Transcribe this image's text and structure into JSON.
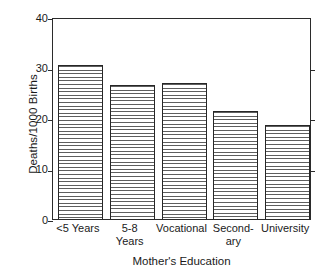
{
  "chart_data": {
    "type": "bar",
    "title": "",
    "xlabel": "Mother's Education",
    "ylabel": "Deaths/1000 Births",
    "categories": [
      "<5 Years",
      "5-8 Years",
      "Vocational",
      "Secondary",
      "University"
    ],
    "category_lines": [
      [
        "<5 Years"
      ],
      [
        "5-8",
        "Years"
      ],
      [
        "Vocational"
      ],
      [
        "Second-",
        "ary"
      ],
      [
        "University"
      ]
    ],
    "values": [
      30.5,
      26.6,
      27.0,
      21.4,
      18.7
    ],
    "ylim": [
      0,
      40
    ],
    "yticks": [
      0,
      10,
      20,
      30,
      40
    ],
    "ytick_labels": [
      "0",
      "10",
      "20",
      "30",
      "40"
    ],
    "grid": false,
    "legend": false,
    "legend_position": "none",
    "bar_fill_pattern": "horizontal-hatch",
    "colors": {
      "bar_edge": "#262626",
      "bar_hatch": "#5e5e5e",
      "bar_background": "#ffffff",
      "axis": "#2b2b2b",
      "text": "#1a1a1a",
      "plot_background": "#ffffff"
    }
  }
}
